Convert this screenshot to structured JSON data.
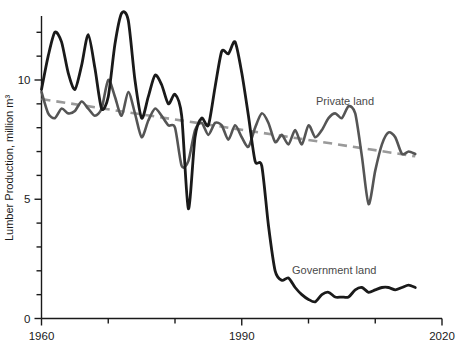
{
  "chart_data": {
    "type": "line",
    "title": "",
    "xlabel": "",
    "ylabel": "Lumber Production, million m³",
    "xlim": [
      1960,
      2020
    ],
    "ylim": [
      0,
      13.2
    ],
    "grid": false,
    "legend_position": "inline-annotations",
    "x_ticks": [
      1960,
      1970,
      1980,
      1990,
      2000,
      2010,
      2020
    ],
    "x_tick_labels": [
      "1960",
      "",
      "",
      "1990",
      "",
      "",
      "2020"
    ],
    "y_ticks": [
      0,
      1,
      2,
      3,
      4,
      5,
      6,
      7,
      8,
      9,
      10,
      11,
      12,
      13
    ],
    "y_tick_labels": [
      "0",
      "",
      "",
      "",
      "",
      "5",
      "",
      "",
      "",
      "",
      "10",
      "",
      "",
      ""
    ],
    "series": [
      {
        "name": "Government land",
        "color": "#1a1a1a",
        "style": "solid",
        "x": [
          1960,
          1961,
          1962,
          1963,
          1964,
          1965,
          1966,
          1967,
          1968,
          1969,
          1970,
          1971,
          1972,
          1973,
          1974,
          1975,
          1976,
          1977,
          1978,
          1979,
          1980,
          1981,
          1982,
          1983,
          1984,
          1985,
          1986,
          1987,
          1988,
          1989,
          1990,
          1991,
          1992,
          1993,
          1994,
          1995,
          1996,
          1997,
          1998,
          1999,
          2000,
          2001,
          2002,
          2003,
          2004,
          2005,
          2006,
          2007,
          2008,
          2009,
          2010,
          2011,
          2012,
          2013,
          2014,
          2015,
          2016
        ],
        "y": [
          9.6,
          11.0,
          12.0,
          11.6,
          10.3,
          9.6,
          10.6,
          11.9,
          10.5,
          8.8,
          9.3,
          11.5,
          12.8,
          12.5,
          10.0,
          8.4,
          9.3,
          10.2,
          9.8,
          9.0,
          9.4,
          8.5,
          4.6,
          7.6,
          8.4,
          8.1,
          9.7,
          11.2,
          11.1,
          11.6,
          10.3,
          8.5,
          6.6,
          6.4,
          3.9,
          2.0,
          1.6,
          1.7,
          1.3,
          1.0,
          0.8,
          0.7,
          1.0,
          1.1,
          0.9,
          0.9,
          0.9,
          1.2,
          1.3,
          1.1,
          1.2,
          1.3,
          1.3,
          1.2,
          1.3,
          1.4,
          1.3
        ]
      },
      {
        "name": "Private land",
        "color": "#555555",
        "style": "solid",
        "x": [
          1960,
          1961,
          1962,
          1963,
          1964,
          1965,
          1966,
          1967,
          1968,
          1969,
          1970,
          1971,
          1972,
          1973,
          1974,
          1975,
          1976,
          1977,
          1978,
          1979,
          1980,
          1981,
          1982,
          1983,
          1984,
          1985,
          1986,
          1987,
          1988,
          1989,
          1990,
          1991,
          1992,
          1993,
          1994,
          1995,
          1996,
          1997,
          1998,
          1999,
          2000,
          2001,
          2002,
          2003,
          2004,
          2005,
          2006,
          2007,
          2008,
          2009,
          2010,
          2011,
          2012,
          2013,
          2014,
          2015,
          2016
        ],
        "y": [
          9.5,
          8.6,
          8.4,
          8.8,
          8.6,
          8.7,
          9.1,
          8.8,
          8.5,
          8.8,
          10.0,
          9.3,
          8.5,
          9.5,
          8.6,
          7.6,
          8.3,
          8.8,
          8.5,
          8.1,
          8.0,
          6.4,
          6.6,
          7.9,
          8.2,
          7.7,
          8.2,
          8.1,
          7.5,
          8.1,
          7.6,
          7.2,
          8.0,
          8.6,
          8.2,
          7.4,
          7.7,
          7.3,
          7.9,
          7.3,
          8.1,
          7.6,
          7.9,
          8.4,
          8.6,
          8.4,
          8.9,
          8.6,
          6.8,
          4.8,
          6.2,
          7.3,
          7.8,
          7.6,
          6.9,
          7.0,
          6.9
        ]
      }
    ],
    "trend_line": {
      "name": "Private land trend",
      "color": "#9a9a9a",
      "style": "dashed",
      "x": [
        1960,
        2016
      ],
      "y": [
        9.2,
        6.8
      ]
    },
    "annotations": [
      {
        "text": "Private land",
        "x": 1998,
        "y": 9.4,
        "color": "#4a4a4a"
      },
      {
        "text": "Government land",
        "x": 1999,
        "y": 2.9,
        "color": "#4a4a4a"
      }
    ]
  },
  "axes": {
    "y_title": "Lumber Production, million m³",
    "y_labels": {
      "zero": "0",
      "five": "5",
      "ten": "10"
    },
    "x_labels": {
      "start": "1960",
      "mid": "1990",
      "end": "2020"
    }
  },
  "labels": {
    "private": "Private land",
    "government": "Government land"
  },
  "colors": {
    "government_line": "#1a1a1a",
    "private_line": "#555555",
    "trend_line": "#9a9a9a",
    "axis": "#1a1a1a",
    "background": "#ffffff"
  }
}
